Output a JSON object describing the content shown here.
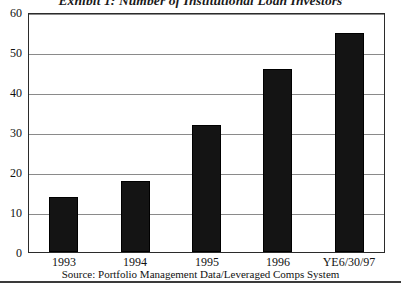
{
  "chart_data": {
    "type": "bar",
    "title": "Exhibit 1: Number of Institutional Loan Investors",
    "categories": [
      "1993",
      "1994",
      "1995",
      "1996",
      "YE6/30/97"
    ],
    "values": [
      14,
      18,
      32,
      46,
      55
    ],
    "xlabel": "",
    "ylabel": "",
    "ylim": [
      0,
      60
    ],
    "yticks": [
      0,
      10,
      20,
      30,
      40,
      50,
      60
    ],
    "ytick_labels": [
      "0",
      "10",
      "20",
      "30",
      "40",
      "50",
      "60"
    ],
    "grid": true,
    "legend": null,
    "bar_color": "#141414",
    "source_note": "Source: Portfolio Management Data/Leveraged Comps System"
  }
}
